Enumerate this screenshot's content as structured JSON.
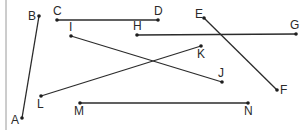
{
  "diagram": {
    "type": "line-segments",
    "border_left_x": 6,
    "segments": [
      {
        "from": "B",
        "to": "A"
      },
      {
        "from": "C",
        "to": "D"
      },
      {
        "from": "E",
        "to": "F"
      },
      {
        "from": "H",
        "to": "G"
      },
      {
        "from": "I",
        "to": "J"
      },
      {
        "from": "K",
        "to": "L"
      },
      {
        "from": "M",
        "to": "N"
      }
    ],
    "points": [
      {
        "id": "A",
        "label": "A",
        "x": 22,
        "y": 118,
        "lx": 11,
        "ly": 124
      },
      {
        "id": "B",
        "label": "B",
        "x": 39,
        "y": 16,
        "lx": 28,
        "ly": 20
      },
      {
        "id": "C",
        "label": "C",
        "x": 57,
        "y": 20,
        "lx": 53,
        "ly": 15
      },
      {
        "id": "D",
        "label": "D",
        "x": 158,
        "y": 20,
        "lx": 154,
        "ly": 15
      },
      {
        "id": "E",
        "label": "E",
        "x": 204,
        "y": 18,
        "lx": 195,
        "ly": 18
      },
      {
        "id": "F",
        "label": "F",
        "x": 277,
        "y": 90,
        "lx": 280,
        "ly": 94
      },
      {
        "id": "G",
        "label": "G",
        "x": 296,
        "y": 34,
        "lx": 290,
        "ly": 29
      },
      {
        "id": "H",
        "label": "H",
        "x": 137,
        "y": 35,
        "lx": 133,
        "ly": 30
      },
      {
        "id": "I",
        "label": "I",
        "x": 71,
        "y": 36,
        "lx": 69,
        "ly": 31
      },
      {
        "id": "J",
        "label": "J",
        "x": 222,
        "y": 82,
        "lx": 218,
        "ly": 77
      },
      {
        "id": "K",
        "label": "K",
        "x": 201,
        "y": 46,
        "lx": 197,
        "ly": 58
      },
      {
        "id": "L",
        "label": "L",
        "x": 41,
        "y": 96,
        "lx": 37,
        "ly": 108
      },
      {
        "id": "M",
        "label": "M",
        "x": 80,
        "y": 103,
        "lx": 74,
        "ly": 115
      },
      {
        "id": "N",
        "label": "N",
        "x": 248,
        "y": 103,
        "lx": 244,
        "ly": 115
      }
    ]
  }
}
